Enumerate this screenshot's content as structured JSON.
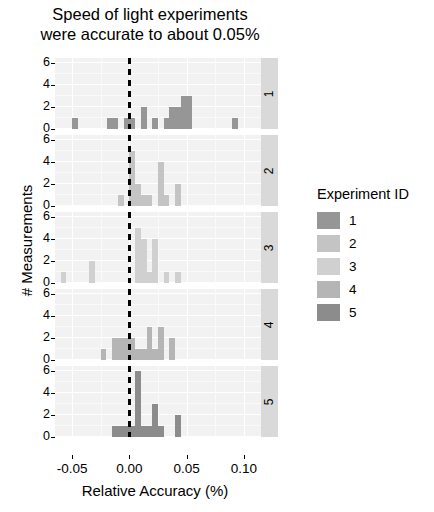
{
  "title": "Speed of light experiments\nwere accurate to about 0.05%",
  "axes": {
    "xlabel": "Relative Accuracy (%)",
    "ylabel": "# Measurements",
    "xticks": [
      "-0.05",
      "0.00",
      "0.05",
      "0.10"
    ],
    "yticks": [
      "0",
      "2",
      "4",
      "6"
    ]
  },
  "legend": {
    "title": "Experiment ID",
    "items": [
      {
        "label": "1",
        "color": "#969696"
      },
      {
        "label": "2",
        "color": "#c4c4c4"
      },
      {
        "label": "3",
        "color": "#d0d0d0"
      },
      {
        "label": "4",
        "color": "#b5b5b5"
      },
      {
        "label": "5",
        "color": "#8c8c8c"
      }
    ]
  },
  "annotation": {
    "reference_line_x": 0.0
  },
  "strips": [
    "1",
    "2",
    "3",
    "4",
    "5"
  ],
  "chart_data": {
    "type": "bar",
    "title": "Speed of light experiments were accurate to about 0.05%",
    "subtitle": "",
    "xlabel": "Relative Accuracy (%)",
    "ylabel": "# Measurements",
    "xlim": [
      -0.065,
      0.115
    ],
    "ylim": [
      0,
      6.5
    ],
    "grid": true,
    "legend_position": "right",
    "legend_title": "Experiment ID",
    "facet_by": "Experiment ID",
    "bin_width": 0.005,
    "reference_line": {
      "x": 0.0,
      "style": "dashed",
      "color": "#000000"
    },
    "panels": [
      {
        "strip": "1",
        "color": "#969696",
        "bins": [
          {
            "x": -0.05,
            "count": 1
          },
          {
            "x": -0.02,
            "count": 1
          },
          {
            "x": -0.015,
            "count": 1
          },
          {
            "x": -0.005,
            "count": 1
          },
          {
            "x": 0.0,
            "count": 1
          },
          {
            "x": 0.01,
            "count": 2
          },
          {
            "x": 0.02,
            "count": 1
          },
          {
            "x": 0.03,
            "count": 1
          },
          {
            "x": 0.035,
            "count": 2
          },
          {
            "x": 0.04,
            "count": 2
          },
          {
            "x": 0.045,
            "count": 3
          },
          {
            "x": 0.05,
            "count": 3
          },
          {
            "x": 0.09,
            "count": 1
          }
        ]
      },
      {
        "strip": "2",
        "color": "#c4c4c4",
        "bins": [
          {
            "x": -0.01,
            "count": 1
          },
          {
            "x": 0.0,
            "count": 5
          },
          {
            "x": 0.005,
            "count": 2
          },
          {
            "x": 0.01,
            "count": 1
          },
          {
            "x": 0.015,
            "count": 1
          },
          {
            "x": 0.025,
            "count": 4
          },
          {
            "x": 0.03,
            "count": 1
          },
          {
            "x": 0.04,
            "count": 2
          }
        ]
      },
      {
        "strip": "3",
        "color": "#d0d0d0",
        "bins": [
          {
            "x": -0.06,
            "count": 1
          },
          {
            "x": -0.035,
            "count": 2
          },
          {
            "x": 0.005,
            "count": 5
          },
          {
            "x": 0.01,
            "count": 4
          },
          {
            "x": 0.015,
            "count": 1
          },
          {
            "x": 0.02,
            "count": 4
          },
          {
            "x": 0.03,
            "count": 1
          },
          {
            "x": 0.04,
            "count": 1
          }
        ]
      },
      {
        "strip": "4",
        "color": "#b5b5b5",
        "bins": [
          {
            "x": -0.025,
            "count": 1
          },
          {
            "x": -0.015,
            "count": 2
          },
          {
            "x": -0.01,
            "count": 2
          },
          {
            "x": -0.005,
            "count": 2
          },
          {
            "x": 0.0,
            "count": 2
          },
          {
            "x": 0.005,
            "count": 1
          },
          {
            "x": 0.01,
            "count": 1
          },
          {
            "x": 0.015,
            "count": 3
          },
          {
            "x": 0.02,
            "count": 1
          },
          {
            "x": 0.025,
            "count": 3
          },
          {
            "x": 0.035,
            "count": 2
          }
        ]
      },
      {
        "strip": "5",
        "color": "#8c8c8c",
        "bins": [
          {
            "x": -0.015,
            "count": 1
          },
          {
            "x": -0.01,
            "count": 1
          },
          {
            "x": -0.005,
            "count": 1
          },
          {
            "x": 0.0,
            "count": 1
          },
          {
            "x": 0.005,
            "count": 6
          },
          {
            "x": 0.01,
            "count": 1
          },
          {
            "x": 0.015,
            "count": 1
          },
          {
            "x": 0.02,
            "count": 3
          },
          {
            "x": 0.025,
            "count": 1
          },
          {
            "x": 0.04,
            "count": 2
          }
        ]
      }
    ]
  }
}
